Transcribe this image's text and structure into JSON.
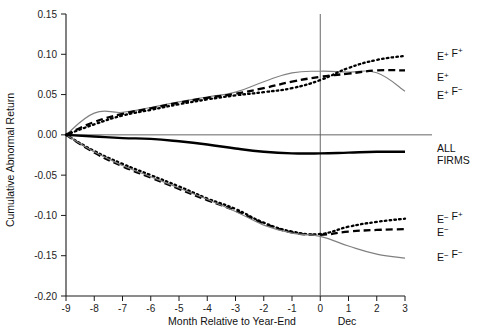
{
  "chart_data": {
    "type": "line",
    "title": "",
    "xlabel": "Month Relative to Year-End",
    "ylabel": "Cumulative Abnormal Return",
    "xlim": [
      -9,
      3
    ],
    "ylim": [
      -0.2,
      0.15
    ],
    "grid": false,
    "legend_position": "right-inline",
    "x": [
      -9,
      -8,
      -7,
      -6,
      -5,
      -4,
      -3,
      -2,
      -1,
      0,
      1,
      2,
      3
    ],
    "xticklabels": [
      "-9",
      "-8",
      "-7",
      "-6",
      "-5",
      "-4",
      "-3",
      "-2",
      "-1",
      "0",
      "1",
      "2",
      "3"
    ],
    "yticklabels": [
      "0.15",
      "0.10",
      "0.05",
      "0.00",
      "-0.05",
      "-0.10",
      "-0.15",
      "-0.20"
    ],
    "yticks": [
      0.15,
      0.1,
      0.05,
      0.0,
      -0.05,
      -0.1,
      -0.15,
      -0.2
    ],
    "zero_reference_line": 0.0,
    "vertical_marker": {
      "x": 0,
      "label": "Dec"
    },
    "series": [
      {
        "name": "E+ F+",
        "label_html": "E<sup>+</sup> F<sup>+</sup>",
        "style": "dotted",
        "color": "#000000",
        "label_y": 0.098,
        "values": [
          0.0,
          0.013,
          0.024,
          0.031,
          0.038,
          0.044,
          0.049,
          0.053,
          0.058,
          0.068,
          0.083,
          0.093,
          0.098
        ]
      },
      {
        "name": "E+",
        "label_html": "E<sup>+</sup>",
        "style": "dashed",
        "color": "#000000",
        "label_y": 0.072,
        "values": [
          0.0,
          0.016,
          0.026,
          0.033,
          0.04,
          0.046,
          0.051,
          0.058,
          0.066,
          0.072,
          0.076,
          0.08,
          0.08
        ]
      },
      {
        "name": "E+ F-",
        "label_html": "E<sup>+</sup> F<sup>&minus;</sup>",
        "style": "gray",
        "color": "#808080",
        "label_y": 0.05,
        "values": [
          0.0,
          0.027,
          0.028,
          0.034,
          0.041,
          0.047,
          0.053,
          0.066,
          0.077,
          0.079,
          0.078,
          0.077,
          0.054
        ]
      },
      {
        "name": "ALL FIRMS",
        "label_html": "ALL<br>FIRMS",
        "style": "solid-thick",
        "color": "#000000",
        "label_y": -0.022,
        "values": [
          0.0,
          -0.002,
          -0.004,
          -0.005,
          -0.008,
          -0.012,
          -0.017,
          -0.021,
          -0.023,
          -0.023,
          -0.022,
          -0.021,
          -0.021
        ]
      },
      {
        "name": "E- F+",
        "label_html": "E<sup>&minus;</sup> F<sup>+</sup>",
        "style": "dotted",
        "color": "#000000",
        "label_y": -0.105,
        "values": [
          0.0,
          -0.02,
          -0.036,
          -0.05,
          -0.064,
          -0.079,
          -0.092,
          -0.109,
          -0.12,
          -0.123,
          -0.114,
          -0.108,
          -0.104
        ]
      },
      {
        "name": "E-",
        "label_html": "E<sup>&minus;</sup>",
        "style": "dashed",
        "color": "#000000",
        "label_y": -0.12,
        "values": [
          0.0,
          -0.022,
          -0.039,
          -0.053,
          -0.067,
          -0.081,
          -0.094,
          -0.11,
          -0.121,
          -0.124,
          -0.12,
          -0.118,
          -0.117
        ]
      },
      {
        "name": "E- F-",
        "label_html": "E<sup>&minus;</sup> F<sup>&minus;</sup>",
        "style": "gray",
        "color": "#808080",
        "label_y": -0.152,
        "values": [
          0.0,
          -0.021,
          -0.038,
          -0.052,
          -0.066,
          -0.08,
          -0.095,
          -0.112,
          -0.122,
          -0.126,
          -0.138,
          -0.148,
          -0.153
        ]
      }
    ]
  },
  "axes": {
    "x_title": "Month Relative to Year-End",
    "y_title": "Cumulative Abnormal Return",
    "dec_marker_label": "Dec"
  },
  "legend": {
    "items": [
      {
        "key": "ep-fp",
        "text": "E+ F+"
      },
      {
        "key": "ep",
        "text": "E+"
      },
      {
        "key": "ep-fm",
        "text": "E+ F-"
      },
      {
        "key": "all-firms",
        "text": "ALL FIRMS"
      },
      {
        "key": "em-fp",
        "text": "E- F+"
      },
      {
        "key": "em",
        "text": "E-"
      },
      {
        "key": "em-fm",
        "text": "E- F-"
      }
    ]
  },
  "colors": {
    "series_black": "#000000",
    "series_gray": "#808080",
    "axis": "#1a1a1a",
    "background": "#ffffff"
  }
}
